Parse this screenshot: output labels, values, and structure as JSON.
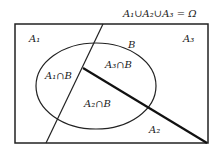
{
  "title": "A₁∪A₂∪A₃ = Ω",
  "regions": {
    "a1": "A₁",
    "a2": "A₂",
    "a3": "A₃",
    "b": "B",
    "a1b": "A₁∩B",
    "a2b": "A₂∩B",
    "a3b": "A₃∩B"
  },
  "colors": {
    "stroke": "#222222",
    "background": "#ffffff"
  }
}
